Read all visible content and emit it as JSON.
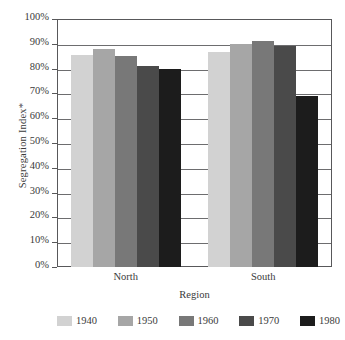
{
  "chart_data": {
    "type": "bar",
    "title": "",
    "subtitle": "",
    "xlabel": "Region",
    "ylabel": "Segregation Index*",
    "categories": [
      "North",
      "South"
    ],
    "series": [
      {
        "name": "1940",
        "color": "#d2d2d2",
        "values": [
          85.5,
          86.5
        ]
      },
      {
        "name": "1950",
        "color": "#a6a6a6",
        "values": [
          88.0,
          90.0
        ]
      },
      {
        "name": "1960",
        "color": "#787878",
        "values": [
          85.0,
          91.0
        ]
      },
      {
        "name": "1970",
        "color": "#4a4a4a",
        "values": [
          81.0,
          89.0
        ]
      },
      {
        "name": "1980",
        "color": "#1c1c1c",
        "values": [
          80.0,
          69.0
        ]
      }
    ],
    "ylim": [
      0,
      100
    ],
    "ytick_step": 10,
    "ytick_labels": [
      "0%",
      "10%",
      "20%",
      "30%",
      "40%",
      "50%",
      "60%",
      "70%",
      "80%",
      "90%",
      "100%"
    ],
    "ytick_values": [
      0,
      10,
      20,
      30,
      40,
      50,
      60,
      70,
      80,
      90,
      100
    ],
    "grid": true,
    "grid_axis": "y",
    "legend_position": "bottom",
    "value_unit": "percent",
    "frame_color": "#58585a",
    "background_color": "#ffffff"
  }
}
